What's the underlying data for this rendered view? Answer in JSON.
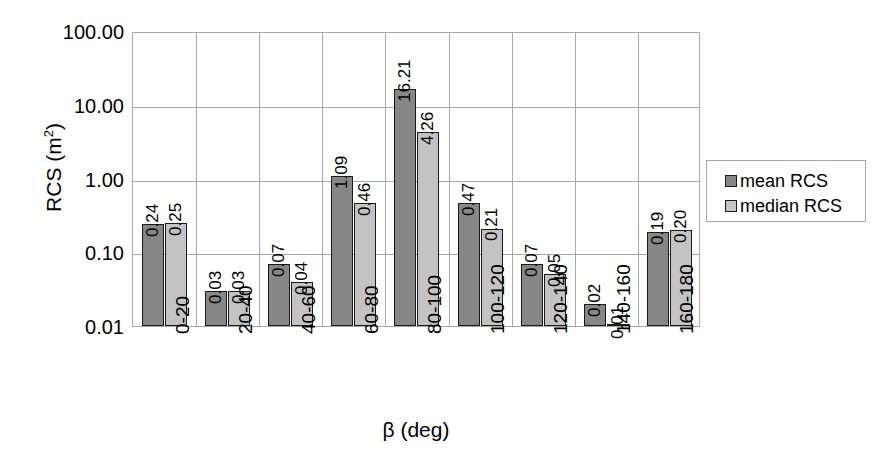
{
  "chart_data": {
    "type": "bar",
    "title": "",
    "xlabel": "β (deg)",
    "ylabel": "RCS (m²)",
    "ylabel_base": "RCS (m",
    "ylabel_sup": "2",
    "ylabel_tail": ")",
    "yscale": "log",
    "ylim": [
      0.01,
      100
    ],
    "ytick_labels": [
      "100.00",
      "10.00",
      "1.00",
      "0.10",
      "0.01"
    ],
    "ytick_values": [
      100,
      10,
      1,
      0.1,
      0.01
    ],
    "grid": true,
    "legend_position": "right",
    "categories": [
      "0-20",
      "20-40",
      "40-60",
      "60-80",
      "80-100",
      "100-120",
      "120-140",
      "140-160",
      "160-180"
    ],
    "series": [
      {
        "name": "mean RCS",
        "color": "#878787",
        "values": [
          0.24,
          0.03,
          0.07,
          1.09,
          16.21,
          0.47,
          0.07,
          0.02,
          0.19
        ],
        "labels": [
          "0.24",
          "0.03",
          "0.07",
          "1.09",
          "16.21",
          "0.47",
          "0.07",
          "0.02",
          "0.19"
        ]
      },
      {
        "name": "median RCS",
        "color": "#c3c3c3",
        "values": [
          0.25,
          0.03,
          0.04,
          0.46,
          4.26,
          0.21,
          0.05,
          0.01,
          0.2
        ],
        "labels": [
          "0.25",
          "0.03",
          "0.04",
          "0.46",
          "4.26",
          "0.21",
          "0.05",
          "0.01",
          "0.20"
        ]
      }
    ]
  },
  "legend": {
    "items": [
      {
        "label": "mean RCS",
        "swatch": "mean"
      },
      {
        "label": "median RCS",
        "swatch": "median"
      }
    ]
  }
}
